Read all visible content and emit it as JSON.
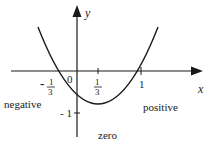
{
  "diagram": {
    "type": "function-graph",
    "axes": {
      "x_label": "x",
      "y_label": "y",
      "origin_label": "0"
    },
    "ticks": {
      "neg_third_sign": "-",
      "neg_third_num": "1",
      "neg_third_den": "3",
      "third_num": "1",
      "third_den": "3",
      "one": "1",
      "y_neg_one": "- 1"
    },
    "region_labels": {
      "negative": "negative",
      "zero": "zero",
      "positive": "positive"
    },
    "colors": {
      "stroke": "#1a1a1a",
      "background": "#ffffff"
    }
  }
}
